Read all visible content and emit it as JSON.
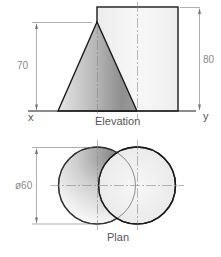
{
  "elevation": {
    "title": "Elevation",
    "ground_left_label": "x",
    "ground_right_label": "y",
    "cone_height_dim": "70",
    "cylinder_height_dim": "80"
  },
  "plan": {
    "title": "Plan",
    "diameter_dim": "ø60"
  },
  "colors": {
    "outline": "#1a1a1a",
    "dimension": "#777777",
    "label": "#555555",
    "cone_shade_dark": "#8c8c8c",
    "cone_shade_light": "#f2f2f2",
    "cylinder_fill": "#f4f4f4"
  }
}
